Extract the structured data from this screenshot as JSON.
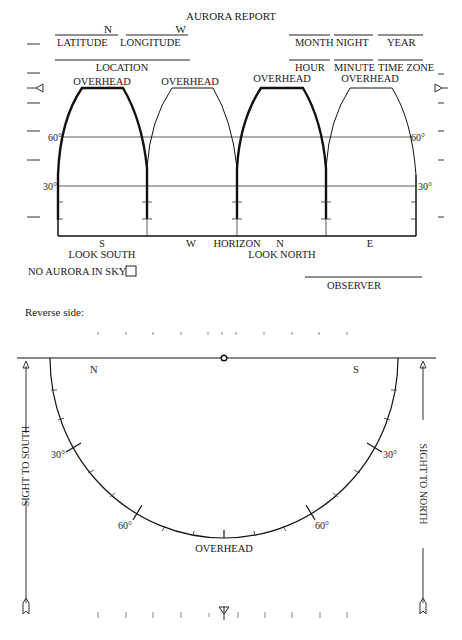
{
  "form": {
    "title": "AURORA REPORT",
    "fields_top": {
      "latitude": {
        "suffix": "N",
        "label": "LATITUDE"
      },
      "longitude": {
        "suffix": "W",
        "label": "LONGITUDE"
      },
      "month": {
        "label": "MONTH"
      },
      "night": {
        "label": "NIGHT"
      },
      "year": {
        "label": "YEAR"
      },
      "location": {
        "label": "LOCATION"
      },
      "hour": {
        "label": "HOUR"
      },
      "minute": {
        "label": "MINUTE"
      },
      "time_zone": {
        "label": "TIME ZONE"
      }
    },
    "panels": [
      {
        "top_label": "OVERHEAD",
        "bottom_label": "S",
        "bold": true
      },
      {
        "top_label": "OVERHEAD",
        "bottom_label": "W",
        "bold": false
      },
      {
        "top_label": "OVERHEAD",
        "bottom_label": "N",
        "bold": true
      },
      {
        "top_label": "OVERHEAD",
        "bottom_label": "E",
        "bold": false
      }
    ],
    "elevation_labels": {
      "sixty": "60°",
      "thirty": "30°"
    },
    "horizon_label": "HORIZON",
    "look_south": "LOOK SOUTH",
    "look_north": "LOOK NORTH",
    "no_aurora": "NO AURORA IN SKY",
    "observer": "OBSERVER"
  },
  "reverse": {
    "heading": "Reverse side:",
    "north": "N",
    "south": "S",
    "deg30": "30°",
    "deg60": "60°",
    "overhead": "OVERHEAD",
    "sight_south": "SIGHT TO SOUTH",
    "sight_north": "SIGHT TO NORTH"
  }
}
